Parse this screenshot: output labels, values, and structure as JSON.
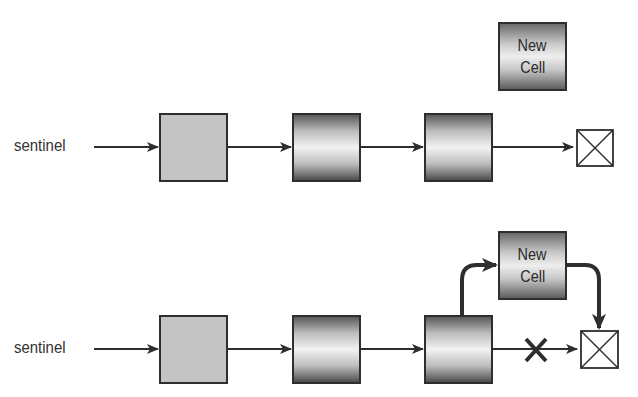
{
  "diagram": {
    "top_row": {
      "sentinel_label": "sentinel",
      "new_cell": {
        "line1": "New",
        "line2": "Cell"
      }
    },
    "bottom_row": {
      "sentinel_label": "sentinel",
      "new_cell": {
        "line1": "New",
        "line2": "Cell"
      }
    },
    "colors": {
      "stroke": "#2e2e2e",
      "sentinel_fill": "#c4c4c4",
      "background": "#ffffff"
    }
  }
}
